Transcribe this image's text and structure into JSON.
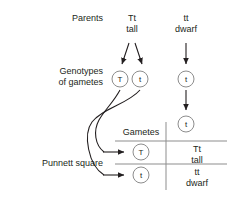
{
  "diagram": {
    "labels": {
      "parents": "Parents",
      "genotypes_of_gametes": "Genotypes\nof gametes",
      "genotypes_line1": "Genotypes",
      "genotypes_line2": "of gametes",
      "punnett_square": "Punnett square",
      "gametes": "Gametes"
    },
    "parents": [
      {
        "genotype": "Tt",
        "phenotype": "tall"
      },
      {
        "genotype": "tt",
        "phenotype": "dwarf"
      }
    ],
    "gamete_circles": [
      {
        "allele": "T",
        "from_parent": "Tt"
      },
      {
        "allele": "t",
        "from_parent": "Tt"
      },
      {
        "allele": "t",
        "from_parent": "tt"
      },
      {
        "allele": "t",
        "from_parent": "tt"
      }
    ],
    "punnett": {
      "column_header_label": "Gametes",
      "column_gamete": "t",
      "row_gametes": [
        "T",
        "t"
      ],
      "offspring": [
        {
          "genotype": "Tt",
          "phenotype": "tall"
        },
        {
          "genotype": "tt",
          "phenotype": "dwarf"
        }
      ]
    },
    "colors": {
      "ink": "#231f20",
      "rule": "#8d8d8d",
      "arrow": "#231f20",
      "background": "#ffffff"
    }
  }
}
